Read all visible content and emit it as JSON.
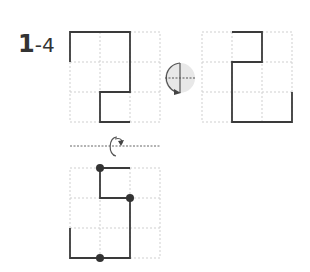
{
  "problem": {
    "number": "1",
    "sub": "-4"
  },
  "colors": {
    "line": "#3a3a3a",
    "grid": "#cccccc",
    "dot": "#333333",
    "icon_fill": "#e6e6e6"
  },
  "figures": [
    {
      "name": "original",
      "grid": "3x3",
      "description": "S-shaped polyline"
    },
    {
      "name": "rotated-180",
      "grid": "3x3",
      "description": "Result after rotation"
    },
    {
      "name": "flipped-answer",
      "grid": "3x3",
      "description": "Result after flip with marked points"
    }
  ],
  "icons": {
    "rotate": "rotate-180-icon",
    "flip": "flip-vertical-icon"
  }
}
